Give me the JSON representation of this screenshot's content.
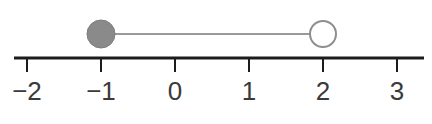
{
  "figure": {
    "width": 432,
    "height": 124,
    "background": "#ffffff"
  },
  "chart_data": {
    "type": "line",
    "title": "",
    "xlabel": "",
    "ylabel": "",
    "axis": {
      "orientation": "horizontal",
      "xlim": [
        -2.19,
        3.38
      ],
      "tick_values": [
        -2,
        -1,
        0,
        1,
        2,
        3
      ],
      "tick_labels": [
        "−2",
        "−1",
        "0",
        "1",
        "2",
        "3"
      ],
      "grid": false,
      "axis_color": "#1c1c1c",
      "axis_line_width": 3,
      "tick_length": 14,
      "tick_width": 2,
      "label_color": "#3a3a3a",
      "label_font_size": 26
    },
    "interval": {
      "start": -1,
      "end": 2,
      "start_inclusive": true,
      "end_inclusive": false,
      "notation": "[-1, 2)",
      "segment_color": "#9a9a9a",
      "segment_width": 2,
      "endpoints": [
        {
          "value": -1,
          "style": "filled",
          "fill": "#8a8a8a",
          "stroke": "#7d7d7d",
          "radius": 14
        },
        {
          "value": 2,
          "style": "open",
          "fill": "#ffffff",
          "stroke": "#8e8e8e",
          "radius": 13
        }
      ]
    },
    "geometry": {
      "axis_y": 58,
      "marker_y": 34,
      "pixels_per_unit": 74,
      "x_origin_px": 175,
      "axis_start_px": 14,
      "axis_end_px": 424,
      "label_baseline_y": 100
    }
  }
}
